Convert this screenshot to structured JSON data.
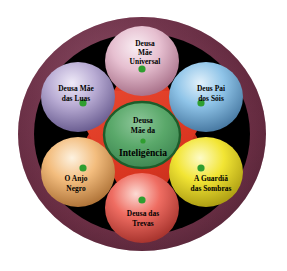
{
  "figure": {
    "title_visible": false,
    "background_color": "#ffffff",
    "outer_ring_color": "#7d3a52",
    "outer_ring_highlight": "#a9627d",
    "outer_ring_shadow": "#4e1f31",
    "inner_field_color": "#000000",
    "star_color": "#d93520",
    "star_shadow_color": "#a82413",
    "vertex_dot_color": "#2f9e2f",
    "center_fill_color": "#5aa86a",
    "center_border_color": "#1d5c2a",
    "text_color": "#000000"
  },
  "center": {
    "name": "center-node",
    "line1": "Deusa",
    "line2": "Mãe da",
    "line3": "Inteligência",
    "dot_color": "#2f9e2f",
    "fill": "#5aa86a"
  },
  "nodes": [
    {
      "id": "node-top",
      "name": "sphere-deusa-mae-universal",
      "position": "top",
      "color": "#e6bfd0",
      "highlight": "#f7eaf0",
      "shadow": "#b07b94",
      "lines": [
        "Deusa",
        "Mãe",
        "Universal"
      ]
    },
    {
      "id": "node-top-right",
      "name": "sphere-deus-pai-dos-sois",
      "position": "top-right",
      "color": "#8fc4e8",
      "highlight": "#dceefa",
      "shadow": "#4e84ad",
      "lines": [
        "Deus Pai",
        "dos Sóis"
      ]
    },
    {
      "id": "node-bottom-right",
      "name": "sphere-a-guardia-das-sombras",
      "position": "bottom-right",
      "color": "#f2e534",
      "highlight": "#fdf9b8",
      "shadow": "#b5a617",
      "lines": [
        "A Guardiã",
        "das Sombras"
      ]
    },
    {
      "id": "node-bottom",
      "name": "sphere-deusa-das-trevas",
      "position": "bottom",
      "color": "#ef6d62",
      "highlight": "#fbd2cb",
      "shadow": "#b03a33",
      "lines": [
        "Deusa das",
        "Trevas"
      ]
    },
    {
      "id": "node-bottom-left",
      "name": "sphere-o-anjo-negro",
      "position": "bottom-left",
      "color": "#f3bd7e",
      "highlight": "#fdeed6",
      "shadow": "#b5793c",
      "lines": [
        "O Anjo",
        "Negro"
      ]
    },
    {
      "id": "node-top-left",
      "name": "sphere-deusa-mae-das-luas",
      "position": "top-left",
      "color": "#b9acd4",
      "highlight": "#ece7f6",
      "shadow": "#6f6296",
      "lines": [
        "Deusa Mãe",
        "das Luas"
      ]
    }
  ],
  "labels": {
    "top_l1": "Deusa",
    "top_l2": "Mãe",
    "top_l3": "Universal",
    "top_right_l1": "Deus Pai",
    "top_right_l2": "dos Sóis",
    "bottom_right_l1": "A Guardiã",
    "bottom_right_l2": "das Sombras",
    "bottom_l1": "Deusa das",
    "bottom_l2": "Trevas",
    "bottom_left_l1": "O Anjo",
    "bottom_left_l2": "Negro",
    "top_left_l1": "Deusa Mãe",
    "top_left_l2": "das Luas",
    "center_l1": "Deusa",
    "center_l2": "Mãe da",
    "center_l3": "Inteligência"
  }
}
